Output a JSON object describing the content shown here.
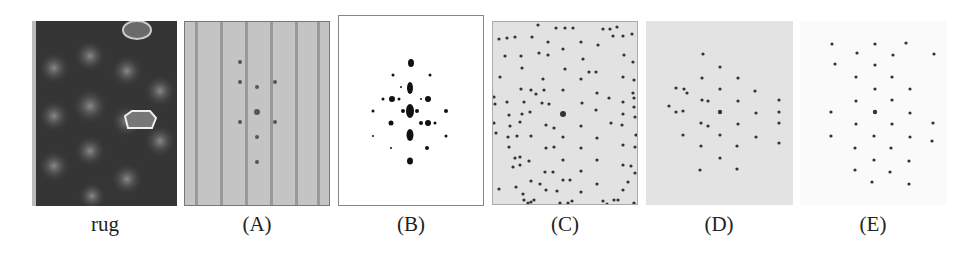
{
  "figure": {
    "panels": [
      {
        "id": "rug",
        "caption": "rug",
        "x": 32,
        "y": 21,
        "w": 145,
        "h": 185
      },
      {
        "id": "A",
        "caption": "(A)",
        "x": 184,
        "y": 21,
        "w": 146,
        "h": 185
      },
      {
        "id": "B",
        "caption": "(B)",
        "x": 338,
        "y": 15,
        "w": 146,
        "h": 191
      },
      {
        "id": "C",
        "caption": "(C)",
        "x": 492,
        "y": 21,
        "w": 146,
        "h": 184
      },
      {
        "id": "D",
        "caption": "(D)",
        "x": 646,
        "y": 21,
        "w": 147,
        "h": 184
      },
      {
        "id": "E",
        "caption": "(E)",
        "x": 800,
        "y": 21,
        "w": 146,
        "h": 184
      }
    ]
  }
}
